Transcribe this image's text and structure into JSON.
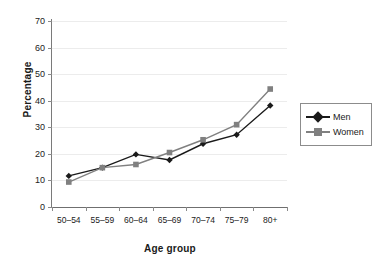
{
  "chart_data": {
    "type": "line",
    "title": "",
    "xlabel": "Age group",
    "ylabel": "Percentage",
    "categories": [
      "50–54",
      "55–59",
      "60–64",
      "65–69",
      "70–74",
      "75–79",
      "80+"
    ],
    "series": [
      {
        "name": "Men",
        "color": "#1a1a1a",
        "marker": "diamond",
        "values": [
          11.7,
          14.8,
          19.8,
          17.7,
          23.8,
          27.2,
          38.2
        ]
      },
      {
        "name": "Women",
        "color": "#808080",
        "marker": "square",
        "values": [
          9.4,
          14.8,
          16.0,
          20.5,
          25.3,
          31.0,
          44.4
        ]
      }
    ],
    "ylim": [
      0,
      70
    ],
    "yticks": [
      0,
      10,
      20,
      30,
      40,
      50,
      60,
      70
    ],
    "ytick_labels": [
      "0",
      "10",
      "20",
      "30",
      "40",
      "50",
      "60",
      "70"
    ],
    "grid": true,
    "legend_position": "right"
  },
  "legend": {
    "items": [
      {
        "label": "Men"
      },
      {
        "label": "Women"
      }
    ]
  },
  "colors": {
    "men": "#1a1a1a",
    "women": "#808080",
    "gridline": "#ececec",
    "axis": "#7a7a7a",
    "background": "#ffffff"
  }
}
